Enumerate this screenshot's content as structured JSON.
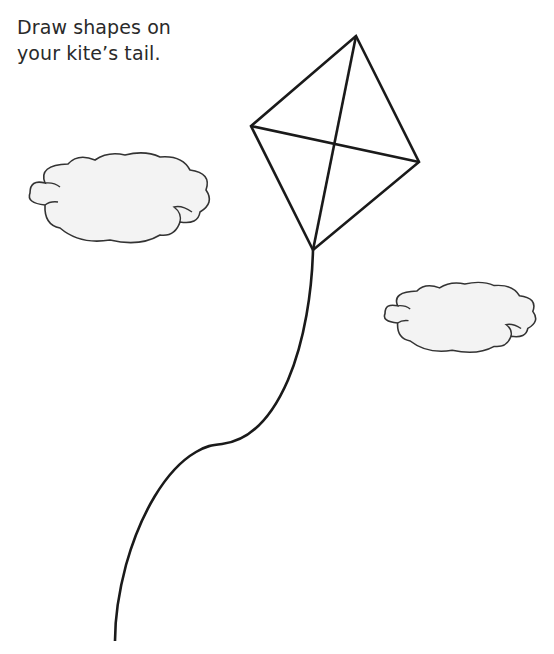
{
  "instruction": {
    "line1": "Draw shapes on",
    "line2": "your kite’s tail."
  },
  "colors": {
    "background": "#ffffff",
    "ink": "#1a1a1a",
    "text": "#2a2a2a",
    "cloud_fill": "#f3f3f3",
    "cloud_outline": "#333333"
  },
  "illustration": {
    "kite": {
      "vertices": {
        "top": [
          356,
          36
        ],
        "left": [
          251,
          126
        ],
        "right": [
          419,
          162
        ],
        "bottom": [
          313,
          250
        ]
      }
    },
    "clouds": [
      {
        "name": "left-cloud",
        "bbox": [
          30,
          155,
          206,
          240
        ]
      },
      {
        "name": "right-cloud",
        "bbox": [
          385,
          284,
          532,
          350
        ]
      }
    ],
    "string": {
      "start": [
        313,
        250
      ],
      "end": [
        115,
        641
      ]
    }
  }
}
